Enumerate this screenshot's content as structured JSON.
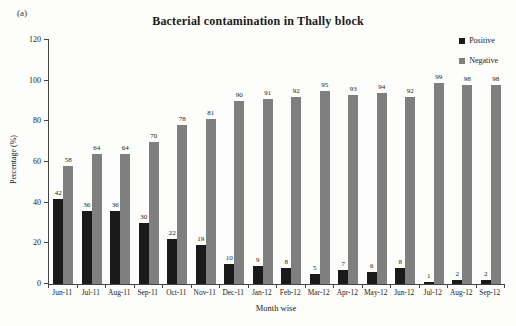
{
  "figure_label": "(a)",
  "chart_data": {
    "type": "bar",
    "title": "Bacterial contamination in Thally block",
    "xlabel": "Month wise",
    "ylabel": "Percentage (%)",
    "ylim": [
      0,
      120
    ],
    "yticks": [
      0,
      20,
      40,
      60,
      80,
      100,
      120
    ],
    "grid": false,
    "legend_position": "top-right",
    "categories": [
      "Jun-11",
      "Jul-11",
      "Aug-11",
      "Sep-11",
      "Oct-11",
      "Nov-11",
      "Dec-11",
      "Jan-12",
      "Feb-12",
      "Mar-12",
      "Apr-12",
      "May-12",
      "Jun-12",
      "Jul-12",
      "Aug-12",
      "Sep-12"
    ],
    "series": [
      {
        "name": "Positive",
        "color": "#1a1a1a",
        "values": [
          42,
          36,
          36,
          30,
          22,
          19,
          10,
          9,
          8,
          5,
          7,
          6,
          8,
          1,
          2,
          2
        ]
      },
      {
        "name": "Negative",
        "color": "#7f7f7f",
        "values": [
          58,
          64,
          64,
          70,
          78,
          81,
          90,
          91,
          92,
          95,
          93,
          94,
          92,
          99,
          98,
          98
        ]
      }
    ]
  }
}
